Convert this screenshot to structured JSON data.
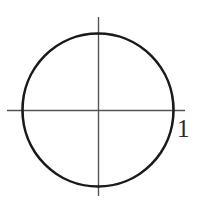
{
  "figure": {
    "background_color": "#ffffff",
    "width": 201,
    "height": 204
  },
  "chart_data": {
    "type": "scatter",
    "title": "",
    "subtitle": "",
    "xlabel": "",
    "ylabel": "",
    "grid": false,
    "legend": null,
    "axes": {
      "origin_px": [
        98,
        110
      ],
      "x_axis": {
        "label": "",
        "from_px": [
          7,
          110
        ],
        "to_px": [
          185,
          110
        ],
        "color": "#555557"
      },
      "y_axis": {
        "label": "",
        "from_px": [
          98,
          17
        ],
        "to_px": [
          98,
          196
        ],
        "color": "#555557"
      }
    },
    "shapes": [
      {
        "kind": "circle",
        "center": [
          0,
          0
        ],
        "center_px": [
          98,
          110
        ],
        "radius": 1,
        "radius_px": 75,
        "stroke": "#1a1a1a",
        "stroke_width": 2.6,
        "fill": "none"
      }
    ],
    "annotations": [
      {
        "text": "1",
        "position_px": [
          183,
          129
        ],
        "anchor": "left",
        "color": "#2b2b2b",
        "meaning": "radius-value"
      }
    ]
  },
  "labels": {
    "radius": "1"
  },
  "colors": {
    "curve": "#1a1a1a",
    "axis": "#555557",
    "label": "#2b2b2b",
    "background": "#ffffff"
  }
}
